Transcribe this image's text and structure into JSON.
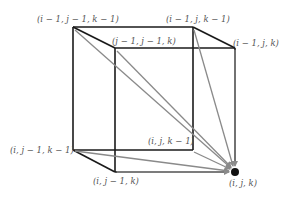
{
  "diagram": {
    "type": "cube-dependency",
    "colors": {
      "edge": "#1a1a1a",
      "arrow": "#8a8a8a",
      "label": "#555555",
      "target_dot": "#111111"
    },
    "vertices": [
      {
        "id": "v_i-1_j-1_k-1",
        "label": "(i − 1, j − 1, k − 1)"
      },
      {
        "id": "v_i-1_j_k-1",
        "label": "(i − 1, j, k − 1)"
      },
      {
        "id": "v_i-1_j-1_k",
        "label": "(j − 1, j − 1, k)"
      },
      {
        "id": "v_i-1_j_k",
        "label": "(i − 1, j, k)"
      },
      {
        "id": "v_i_j-1_k-1",
        "label": "(i, j − 1, k − 1)"
      },
      {
        "id": "v_i_j_k-1",
        "label": "(i, j, k − 1)"
      },
      {
        "id": "v_i_j-1_k",
        "label": "(i, j − 1, k)"
      },
      {
        "id": "v_i_j_k",
        "label": "(i, j, k)"
      }
    ],
    "arrows_to": "v_i_j_k",
    "arrows_from": [
      "v_i-1_j-1_k-1",
      "v_i-1_j_k-1",
      "v_i-1_j-1_k",
      "v_i-1_j_k",
      "v_i_j-1_k-1",
      "v_i_j_k-1",
      "v_i_j-1_k"
    ]
  }
}
